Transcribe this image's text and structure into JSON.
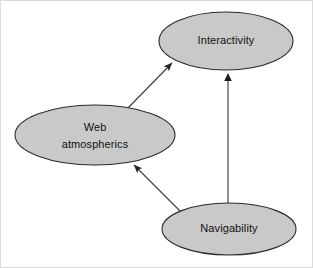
{
  "diagram": {
    "background_color": "#ffffff",
    "frame_color": "#d8d8d8",
    "node_fill_color": "#c9c9c9",
    "node_stroke_color": "#2b2b2b",
    "edge_color": "#3a3a3a",
    "text_color": "#111111",
    "nodes": [
      {
        "id": "interactivity",
        "label": "Interactivity",
        "lines": [
          "Interactivity"
        ],
        "cx": 226,
        "cy": 41,
        "rx": 67,
        "ry": 29
      },
      {
        "id": "web-atmospherics",
        "label": "Web atmospherics",
        "lines": [
          "Web",
          "atmospherics"
        ],
        "cx": 95,
        "cy": 135,
        "rx": 80,
        "ry": 30
      },
      {
        "id": "navigability",
        "label": "Navigability",
        "lines": [
          "Navigability"
        ],
        "cx": 229,
        "cy": 229,
        "rx": 67,
        "ry": 26
      }
    ],
    "edges": [
      {
        "id": "web-atmospherics-to-interactivity",
        "from": "web-atmospherics",
        "to": "interactivity",
        "arrowhead": "filled-triangle",
        "x1": 127,
        "y1": 109,
        "x2": 172,
        "y2": 63
      },
      {
        "id": "navigability-to-interactivity",
        "from": "navigability",
        "to": "interactivity",
        "arrowhead": "filled-triangle",
        "x1": 228,
        "y1": 203,
        "x2": 228,
        "y2": 71
      },
      {
        "id": "navigability-to-web-atmospherics",
        "from": "navigability",
        "to": "web-atmospherics",
        "arrowhead": "filled-triangle",
        "x1": 181,
        "y1": 212,
        "x2": 134,
        "y2": 165
      }
    ]
  }
}
